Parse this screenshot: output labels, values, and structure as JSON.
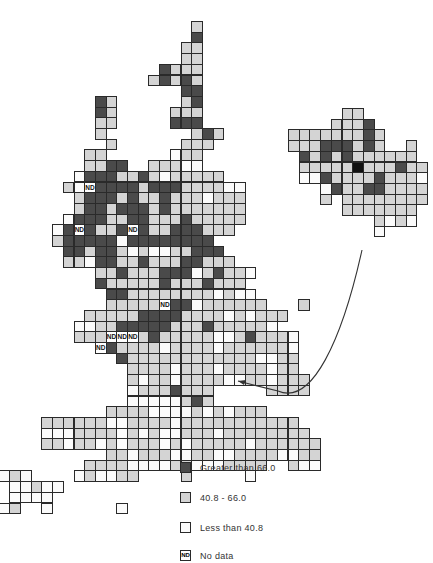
{
  "map": {
    "cell_size": 10.7,
    "main": {
      "origin": [
        20,
        21
      ],
      "rows": [
        "                L",
        "                D",
        "               LL",
        "               LL",
        "             DLLL",
        "            LDLDL",
        "               DD",
        "       DL      LD",
        "       DL     LLL",
        "       LL     DDD",
        "       L        LDL",
        "        L      LLL",
        "      LL      WLL",
        "      LLDD  LLLWW",
        "     WDDDLLDLWLLLLL",
        "    LWNDDDDLDDDLLLLWW",
        "     LDDDLDLLDLLLWLLL",
        "     LDDLDDDLDLLLLLLL",
        "    WDDDLLDDLLLDLLLLL",
        "   WDNDLLDNDLLDDDLLL",
        "   LDDDDDWDDDDDDDD",
        "    DDLDDLWLWWLLDDD",
        "    LLWDDLLDLLLDDLLL",
        "       LLDLLLDDDWLDLLW",
        "       DLLLLLDLLLDLLL",
        "        DDLLLLLLLLWLWW",
        "        LLLLLNDDWLLLLLL   L",
        "      LLLLLDDDDLLLLWLWLLL",
        "     WWLLDDDDDLLLDLLLLLW",
        "     LLLNNNLDLLLLLWWLDLLLW",
        "       NDLLLLWLLLLWLLLLLLW",
        "         DLLLLLLLLLLLLWWLL",
        "          LLLLWLLLWLLLLWLL",
        "          LWLLWLLLLWWLLWLLL",
        "          WLLLDLLL     LLLL",
        "          WWWWWLDL",
        "        LLLLWWWWLWLWLLL",
        "  LLLLLLWWLLLLWLLLLLLLLLLL",
        "  WWWLLLLWLWLWWLLLWLLLLLLLL",
        "  LLWLLWLWLLLWLWLLLLLWLLLLLL",
        "        LLWLLLWWLLWWLLLLWWLL",
        "      LLLLWWWWLLWWWLLLL  LWW",
        "     WLWWLL    L     W"
      ]
    },
    "southwest_tail": {
      "cells": [
        {
          "c": -2,
          "r": 42,
          "v": "W"
        },
        {
          "c": -1,
          "r": 42,
          "v": "L"
        },
        {
          "c": 0,
          "r": 42,
          "v": "W"
        },
        {
          "c": -1,
          "r": 43,
          "v": "W"
        },
        {
          "c": 0,
          "r": 43,
          "v": "W"
        },
        {
          "c": 1,
          "r": 43,
          "v": "L"
        },
        {
          "c": 2,
          "r": 43,
          "v": "W"
        },
        {
          "c": 3,
          "r": 43,
          "v": "W"
        },
        {
          "c": -1,
          "r": 44,
          "v": "W"
        },
        {
          "c": 0,
          "r": 44,
          "v": "W"
        },
        {
          "c": 1,
          "r": 44,
          "v": "W"
        },
        {
          "c": 2,
          "r": 44,
          "v": "W"
        },
        {
          "c": -2,
          "r": 45,
          "v": "W"
        },
        {
          "c": -1,
          "r": 45,
          "v": "L"
        },
        {
          "c": 2,
          "r": 45,
          "v": "W"
        },
        {
          "c": 9,
          "r": 45,
          "v": "W"
        }
      ]
    },
    "inset": {
      "origin": [
        288,
        108
      ],
      "rows": [
        "     LL",
        "    LLLD",
        "LLLLLLLDL",
        "LLLDDDLDL  L",
        " DLDLDLLLLLL",
        " LLLLLKLLLDLL",
        " WWDLLLLDLLLW",
        "   WDLLDDLLLL",
        "   L LLLLLLLL",
        "     LLLLLLL",
        "        LWLW",
        "        W"
      ]
    },
    "arrow": {
      "from": [
        362,
        250
      ],
      "to": [
        238,
        381
      ]
    }
  },
  "legend": {
    "items": [
      {
        "key": "D",
        "label": "Greater than 66.0",
        "color": "#4a4a4a"
      },
      {
        "key": "L",
        "label": "40.8 - 66.0",
        "color": "#d4d4d4"
      },
      {
        "key": "W",
        "label": "Less than 40.8",
        "color": "#fbfbfb"
      },
      {
        "key": "N",
        "swatch_text": "ND",
        "label": "No data",
        "color": "#ffffff"
      }
    ]
  },
  "nd_label": "ND"
}
